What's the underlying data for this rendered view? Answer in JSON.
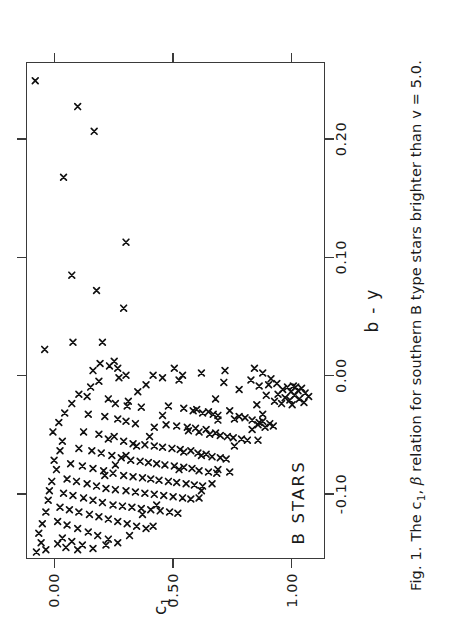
{
  "figure": {
    "caption_prefix": "Fig. 1. The c",
    "caption_sub": "1",
    "caption_mid": ", ",
    "caption_greek": "β",
    "caption_suffix": " relation for southern B type stars brighter than v = 5.0.",
    "rotation_degrees": -90,
    "marker": "x",
    "marker_color": "#111111",
    "frame_color": "#3a3a3a",
    "background": "#ffffff"
  },
  "annotations": [
    {
      "name": "b-stars-label",
      "text": "B  STARS",
      "x": 0.112,
      "y": 0.905
    }
  ],
  "chart_data": {
    "type": "scatter",
    "title": "",
    "xlabel": "b - y",
    "ylabel": "c₁",
    "xlim": [
      -0.155,
      0.265
    ],
    "ylim": [
      -0.12,
      1.14
    ],
    "y_inverted": true,
    "grid": false,
    "legend": null,
    "xticks": [
      -0.1,
      0.0,
      0.1,
      0.2
    ],
    "xticklabels": [
      "-0.10",
      "0.00",
      "0.10",
      "0.20"
    ],
    "yticks": [
      0.0,
      0.5,
      1.0
    ],
    "yticklabels": [
      "0.00",
      "0.50",
      "1.00"
    ],
    "series": [
      {
        "name": "B type stars",
        "marker": "x",
        "points": [
          [
            0.25,
            -0.085
          ],
          [
            0.228,
            0.095
          ],
          [
            0.207,
            0.165
          ],
          [
            0.168,
            0.035
          ],
          [
            0.113,
            0.3
          ],
          [
            0.085,
            0.07
          ],
          [
            0.072,
            0.175
          ],
          [
            0.057,
            0.29
          ],
          [
            0.028,
            0.075
          ],
          [
            0.028,
            0.2
          ],
          [
            0.022,
            -0.045
          ],
          [
            0.012,
            0.25
          ],
          [
            0.01,
            0.19
          ],
          [
            0.008,
            0.23
          ],
          [
            0.006,
            0.265
          ],
          [
            0.004,
            0.16
          ],
          [
            0.002,
            0.62
          ],
          [
            0.0,
            0.3
          ],
          [
            0.0,
            0.415
          ],
          [
            -0.002,
            0.27
          ],
          [
            -0.004,
            0.525
          ],
          [
            -0.005,
            0.185
          ],
          [
            -0.006,
            0.715
          ],
          [
            -0.007,
            0.94
          ],
          [
            -0.008,
            0.905
          ],
          [
            -0.009,
            1.01
          ],
          [
            -0.01,
            0.985
          ],
          [
            -0.01,
            1.02
          ],
          [
            -0.011,
            1.045
          ],
          [
            -0.012,
            0.965
          ],
          [
            -0.013,
            1.03
          ],
          [
            -0.014,
            1.0
          ],
          [
            -0.015,
            1.06
          ],
          [
            -0.016,
            0.945
          ],
          [
            -0.017,
            1.015
          ],
          [
            -0.018,
            1.075
          ],
          [
            -0.019,
            0.975
          ],
          [
            -0.02,
            1.035
          ],
          [
            -0.021,
            0.995
          ],
          [
            -0.022,
            0.93
          ],
          [
            -0.023,
            1.055
          ],
          [
            -0.024,
            0.96
          ],
          [
            -0.025,
            1.005
          ],
          [
            -0.018,
            0.135
          ],
          [
            -0.02,
            0.225
          ],
          [
            -0.022,
            0.31
          ],
          [
            -0.024,
            0.255
          ],
          [
            -0.026,
            0.305
          ],
          [
            -0.027,
            0.365
          ],
          [
            -0.028,
            0.545
          ],
          [
            -0.029,
            0.6
          ],
          [
            -0.03,
            0.585
          ],
          [
            -0.031,
            0.65
          ],
          [
            -0.032,
            0.625
          ],
          [
            -0.033,
            0.67
          ],
          [
            -0.034,
            0.69
          ],
          [
            -0.035,
            0.78
          ],
          [
            -0.036,
            0.805
          ],
          [
            -0.037,
            0.76
          ],
          [
            -0.038,
            0.835
          ],
          [
            -0.039,
            0.88
          ],
          [
            -0.04,
            0.865
          ],
          [
            -0.041,
            0.91
          ],
          [
            -0.042,
            0.86
          ],
          [
            -0.043,
            0.925
          ],
          [
            -0.044,
            0.89
          ],
          [
            -0.033,
            0.14
          ],
          [
            -0.035,
            0.21
          ],
          [
            -0.037,
            0.265
          ],
          [
            -0.039,
            0.3
          ],
          [
            -0.041,
            0.34
          ],
          [
            -0.042,
            0.47
          ],
          [
            -0.043,
            0.515
          ],
          [
            -0.044,
            0.56
          ],
          [
            -0.045,
            0.595
          ],
          [
            -0.046,
            0.64
          ],
          [
            -0.047,
            0.565
          ],
          [
            -0.048,
            0.61
          ],
          [
            -0.049,
            0.68
          ],
          [
            -0.05,
            0.655
          ],
          [
            -0.051,
            0.7
          ],
          [
            -0.052,
            0.73
          ],
          [
            -0.053,
            0.755
          ],
          [
            -0.054,
            0.79
          ],
          [
            -0.055,
            0.815
          ],
          [
            -0.048,
            0.12
          ],
          [
            -0.05,
            0.185
          ],
          [
            -0.052,
            0.25
          ],
          [
            -0.054,
            0.225
          ],
          [
            -0.056,
            0.29
          ],
          [
            -0.058,
            0.33
          ],
          [
            -0.059,
            0.38
          ],
          [
            -0.06,
            0.42
          ],
          [
            -0.061,
            0.455
          ],
          [
            -0.062,
            0.495
          ],
          [
            -0.063,
            0.53
          ],
          [
            -0.064,
            0.575
          ],
          [
            -0.065,
            0.545
          ],
          [
            -0.066,
            0.605
          ],
          [
            -0.067,
            0.64
          ],
          [
            -0.068,
            0.62
          ],
          [
            -0.069,
            0.665
          ],
          [
            -0.07,
            0.7
          ],
          [
            -0.071,
            0.725
          ],
          [
            -0.062,
            0.1
          ],
          [
            -0.064,
            0.155
          ],
          [
            -0.066,
            0.195
          ],
          [
            -0.068,
            0.24
          ],
          [
            -0.07,
            0.28
          ],
          [
            -0.072,
            0.32
          ],
          [
            -0.073,
            0.36
          ],
          [
            -0.074,
            0.395
          ],
          [
            -0.075,
            0.43
          ],
          [
            -0.076,
            0.465
          ],
          [
            -0.077,
            0.505
          ],
          [
            -0.078,
            0.545
          ],
          [
            -0.079,
            0.58
          ],
          [
            -0.08,
            0.525
          ],
          [
            -0.081,
            0.61
          ],
          [
            -0.082,
            0.65
          ],
          [
            -0.083,
            0.685
          ],
          [
            -0.075,
            0.065
          ],
          [
            -0.077,
            0.115
          ],
          [
            -0.079,
            0.16
          ],
          [
            -0.081,
            0.205
          ],
          [
            -0.083,
            0.245
          ],
          [
            -0.085,
            0.29
          ],
          [
            -0.086,
            0.33
          ],
          [
            -0.087,
            0.37
          ],
          [
            -0.088,
            0.405
          ],
          [
            -0.089,
            0.44
          ],
          [
            -0.09,
            0.48
          ],
          [
            -0.091,
            0.515
          ],
          [
            -0.092,
            0.555
          ],
          [
            -0.093,
            0.59
          ],
          [
            -0.094,
            0.625
          ],
          [
            -0.088,
            0.05
          ],
          [
            -0.09,
            0.09
          ],
          [
            -0.092,
            0.135
          ],
          [
            -0.094,
            0.175
          ],
          [
            -0.096,
            0.215
          ],
          [
            -0.097,
            0.255
          ],
          [
            -0.098,
            0.3
          ],
          [
            -0.099,
            0.34
          ],
          [
            -0.1,
            0.38
          ],
          [
            -0.101,
            0.42
          ],
          [
            -0.102,
            0.46
          ],
          [
            -0.103,
            0.5
          ],
          [
            -0.104,
            0.54
          ],
          [
            -0.105,
            0.575
          ],
          [
            -0.1,
            0.035
          ],
          [
            -0.102,
            0.075
          ],
          [
            -0.104,
            0.12
          ],
          [
            -0.106,
            0.16
          ],
          [
            -0.108,
            0.2
          ],
          [
            -0.11,
            0.245
          ],
          [
            -0.111,
            0.285
          ],
          [
            -0.112,
            0.325
          ],
          [
            -0.113,
            0.365
          ],
          [
            -0.114,
            0.405
          ],
          [
            -0.115,
            0.445
          ],
          [
            -0.116,
            0.485
          ],
          [
            -0.117,
            0.52
          ],
          [
            -0.112,
            0.02
          ],
          [
            -0.114,
            0.06
          ],
          [
            -0.116,
            0.1
          ],
          [
            -0.118,
            0.145
          ],
          [
            -0.12,
            0.185
          ],
          [
            -0.122,
            0.225
          ],
          [
            -0.124,
            0.265
          ],
          [
            -0.126,
            0.305
          ],
          [
            -0.128,
            0.345
          ],
          [
            -0.13,
            0.385
          ],
          [
            -0.124,
            0.01
          ],
          [
            -0.127,
            0.05
          ],
          [
            -0.13,
            0.095
          ],
          [
            -0.133,
            0.14
          ],
          [
            -0.136,
            0.18
          ],
          [
            -0.139,
            0.225
          ],
          [
            -0.142,
            0.265
          ],
          [
            -0.138,
            0.03
          ],
          [
            -0.141,
            0.07
          ],
          [
            -0.144,
            0.115
          ],
          [
            -0.147,
            0.16
          ],
          [
            -0.08,
            0.69
          ],
          [
            -0.082,
            0.74
          ],
          [
            -0.06,
            0.76
          ],
          [
            -0.055,
            0.86
          ],
          [
            -0.046,
            0.835
          ],
          [
            -0.038,
            0.69
          ],
          [
            -0.03,
            0.74
          ],
          [
            -0.02,
            0.68
          ],
          [
            -0.012,
            0.78
          ],
          [
            -0.004,
            0.83
          ],
          [
            0.0,
            0.54
          ],
          [
            0.004,
            0.72
          ],
          [
            -0.092,
            0.665
          ],
          [
            -0.098,
            0.62
          ],
          [
            -0.104,
            0.61
          ],
          [
            -0.11,
            0.43
          ],
          [
            -0.118,
            0.37
          ],
          [
            -0.128,
            0.415
          ],
          [
            -0.136,
            0.315
          ],
          [
            -0.144,
            0.215
          ],
          [
            -0.148,
            0.095
          ],
          [
            -0.146,
            0.045
          ],
          [
            -0.143,
            0.01
          ],
          [
            -0.026,
            0.48
          ],
          [
            -0.034,
            0.455
          ],
          [
            -0.044,
            0.42
          ],
          [
            -0.052,
            0.4
          ],
          [
            -0.06,
            0.345
          ],
          [
            -0.068,
            0.3
          ],
          [
            -0.076,
            0.255
          ],
          [
            -0.085,
            0.21
          ],
          [
            -0.014,
            0.35
          ],
          [
            -0.008,
            0.385
          ],
          [
            -0.002,
            0.455
          ],
          [
            0.006,
            0.505
          ],
          [
            -0.01,
            0.15
          ],
          [
            -0.016,
            0.1
          ],
          [
            -0.024,
            0.07
          ],
          [
            -0.032,
            0.04
          ],
          [
            -0.04,
            0.015
          ],
          [
            -0.048,
            -0.01
          ],
          [
            -0.056,
            0.03
          ],
          [
            -0.064,
            0.02
          ],
          [
            -0.072,
            -0.005
          ],
          [
            -0.08,
            0.005
          ],
          [
            -0.09,
            -0.015
          ],
          [
            -0.098,
            -0.025
          ],
          [
            -0.106,
            -0.03
          ],
          [
            -0.116,
            -0.04
          ],
          [
            -0.126,
            -0.055
          ],
          [
            -0.134,
            -0.07
          ],
          [
            -0.142,
            -0.06
          ],
          [
            -0.15,
            -0.08
          ],
          [
            -0.148,
            -0.04
          ],
          [
            -0.033,
            0.88
          ],
          [
            -0.025,
            0.855
          ],
          [
            -0.017,
            0.895
          ],
          [
            -0.009,
            0.865
          ],
          [
            -0.003,
            0.915
          ],
          [
            0.002,
            0.88
          ],
          [
            0.006,
            0.845
          ]
        ]
      }
    ]
  }
}
